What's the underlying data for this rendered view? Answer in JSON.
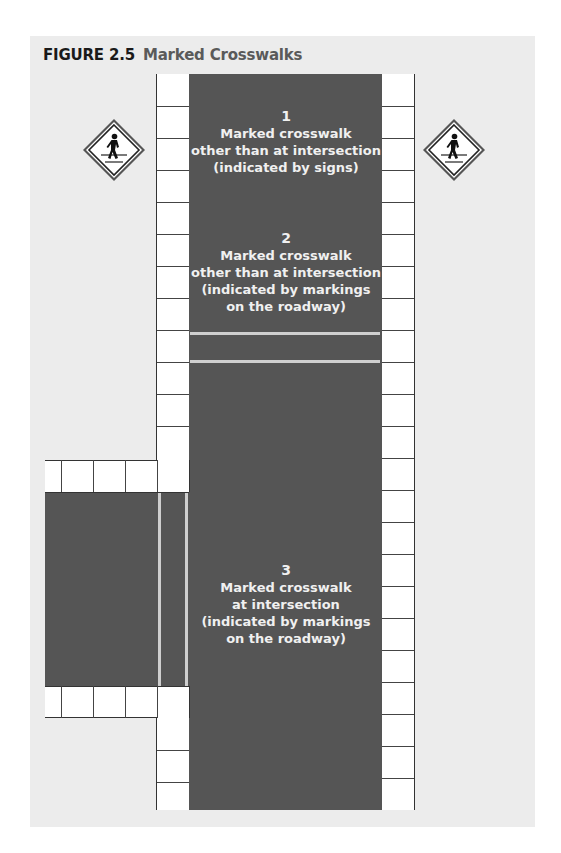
{
  "figure": {
    "number": "FIGURE 2.5",
    "title": "Marked Crosswalks"
  },
  "colors": {
    "background": "#ffffff",
    "panel": "#ececec",
    "road": "#555555",
    "sidewalk": "#ffffff",
    "crosswalk_marking": "#cfcfcf",
    "label_text": "#f0f0f0"
  },
  "signs": [
    {
      "position": "left",
      "icon": "pedestrian-crossing-sign-icon"
    },
    {
      "position": "right",
      "icon": "pedestrian-crossing-sign-icon"
    }
  ],
  "crosswalks": [
    {
      "number": "1",
      "lines": [
        "Marked crosswalk",
        "other than at intersection",
        "(indicated by signs)"
      ]
    },
    {
      "number": "2",
      "lines": [
        "Marked crosswalk",
        "other than at intersection",
        "(indicated by markings",
        "on the roadway)"
      ]
    },
    {
      "number": "3",
      "lines": [
        "Marked crosswalk",
        "at intersection",
        "(indicated by markings",
        "on the roadway)"
      ]
    }
  ]
}
